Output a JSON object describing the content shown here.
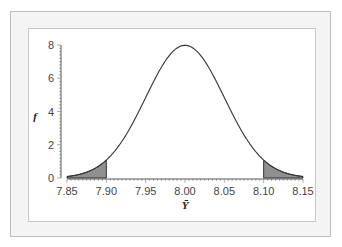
{
  "chart_data": {
    "type": "line",
    "title": "",
    "xlabel": "Ȳ",
    "ylabel": "f",
    "xlim": [
      7.85,
      8.15
    ],
    "ylim": [
      0,
      8
    ],
    "x_ticks": [
      "7.85",
      "7.90",
      "7.95",
      "8.00",
      "8.05",
      "8.10",
      "8.15"
    ],
    "y_ticks": [
      "0",
      "2",
      "4",
      "6",
      "8"
    ],
    "series": [
      {
        "name": "Normal density of sample mean",
        "distribution": "normal",
        "mean": 8.0,
        "sd": 0.05,
        "x": [
          7.85,
          7.875,
          7.9,
          7.925,
          7.95,
          7.975,
          8.0,
          8.025,
          8.05,
          8.075,
          8.1,
          8.125,
          8.15
        ],
        "values": [
          0.09,
          0.35,
          1.08,
          2.59,
          4.84,
          7.04,
          7.98,
          7.04,
          4.84,
          2.59,
          1.08,
          0.35,
          0.09
        ]
      }
    ],
    "shaded_regions": [
      {
        "from": 7.85,
        "to": 7.9,
        "color": "#909090"
      },
      {
        "from": 8.1,
        "to": 8.15,
        "color": "#909090"
      }
    ],
    "grid": false,
    "legend": null
  }
}
